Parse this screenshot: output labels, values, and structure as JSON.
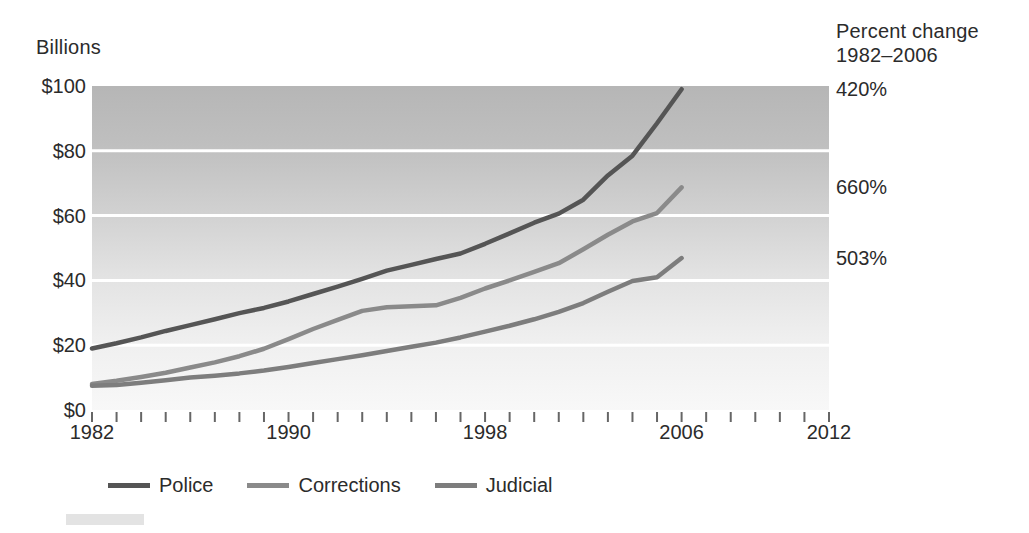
{
  "labels": {
    "y_axis_unit": "Billions",
    "percent_change_line1": "Percent change",
    "percent_change_line2": "1982–2006"
  },
  "y_ticks": [
    "$0",
    "$20",
    "$40",
    "$60",
    "$80",
    "$100"
  ],
  "x_ticks": [
    "1982",
    "1990",
    "1998",
    "2006",
    "2012"
  ],
  "percent_change_values": [
    {
      "series": "Police",
      "value": "420%"
    },
    {
      "series": "Corrections",
      "value": "660%"
    },
    {
      "series": "Judicial",
      "value": "503%"
    }
  ],
  "legend": [
    {
      "label": "Police",
      "color": "#555555"
    },
    {
      "label": "Corrections",
      "color": "#8a8a8a"
    },
    {
      "label": "Judicial",
      "color": "#7d7d7d"
    }
  ],
  "chart_data": {
    "type": "line",
    "title": "",
    "subtitle": "",
    "xlabel": "",
    "ylabel": "Billions",
    "xlim": [
      1982,
      2012
    ],
    "ylim": [
      0,
      100
    ],
    "grid": true,
    "gridlines_y": [
      20,
      40,
      60,
      80
    ],
    "legend_position": "bottom",
    "tick_interval_x": 1,
    "labeled_ticks_x": [
      1982,
      1990,
      1998,
      2006,
      2012
    ],
    "annotations": [
      {
        "text": "420%",
        "series": "Police",
        "period": "1982-2006"
      },
      {
        "text": "660%",
        "series": "Corrections",
        "period": "1982-2006"
      },
      {
        "text": "503%",
        "series": "Judicial",
        "period": "1982-2006"
      }
    ],
    "x": [
      1982,
      1983,
      1984,
      1985,
      1986,
      1987,
      1988,
      1989,
      1990,
      1991,
      1992,
      1993,
      1994,
      1995,
      1996,
      1997,
      1998,
      1999,
      2000,
      2001,
      2002,
      2003,
      2004,
      2005,
      2006
    ],
    "series": [
      {
        "name": "Police",
        "color": "#555555",
        "values": [
          19.0,
          20.6,
          22.4,
          24.4,
          26.2,
          28.0,
          29.9,
          31.5,
          33.5,
          35.8,
          38.1,
          40.5,
          43.0,
          44.8,
          46.6,
          48.3,
          51.3,
          54.5,
          57.8,
          60.6,
          64.9,
          72.4,
          78.5,
          88.5,
          99.0
        ]
      },
      {
        "name": "Corrections",
        "color": "#8a8a8a",
        "values": [
          8.0,
          9.0,
          10.2,
          11.5,
          13.1,
          14.7,
          16.6,
          18.9,
          21.9,
          25.0,
          27.8,
          30.6,
          31.7,
          32.0,
          32.3,
          34.6,
          37.5,
          40.0,
          42.6,
          45.3,
          49.6,
          54.1,
          58.2,
          60.8,
          68.7
        ]
      },
      {
        "name": "Judicial",
        "color": "#7d7d7d",
        "values": [
          7.5,
          7.7,
          8.4,
          9.2,
          10.0,
          10.6,
          11.3,
          12.2,
          13.3,
          14.5,
          15.7,
          16.9,
          18.2,
          19.5,
          20.8,
          22.4,
          24.2,
          26.0,
          28.0,
          30.3,
          33.0,
          36.5,
          39.8,
          41.0,
          46.9
        ]
      }
    ]
  },
  "plot_area": {
    "left": 92,
    "top": 86,
    "right": 829,
    "bottom": 410
  },
  "background": {
    "gradient_top": "#b6b6b6",
    "gradient_bottom": "#f7f7f7",
    "gridline_color": "#ffffff"
  }
}
